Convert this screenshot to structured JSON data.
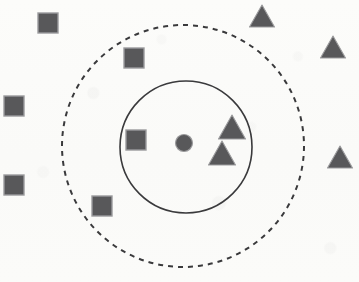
{
  "figure": {
    "canvas": {
      "width": 359,
      "height": 282,
      "background": "#fbfbf9"
    },
    "palette": {
      "shape_fill": "#58585a",
      "shape_stroke": "#9b9b9d",
      "boundary_stroke": "#3a3a3c",
      "background": "#fbfbf9"
    },
    "boundaries": [
      {
        "name": "outer-boundary",
        "shape": "circle",
        "style": "dashed",
        "cx": 183,
        "cy": 146,
        "r": 121,
        "stroke": "#3a3a3c",
        "stroke_width": 2,
        "dash": "5 5"
      },
      {
        "name": "inner-boundary",
        "shape": "circle",
        "style": "solid",
        "cx": 186,
        "cy": 147,
        "r": 66,
        "stroke": "#3a3a3c",
        "stroke_width": 1.6,
        "dash": "none"
      }
    ],
    "centroid": {
      "name": "centroid-marker",
      "shape": "circle",
      "cx": 184,
      "cy": 143,
      "r": 8.5,
      "fill": "#58585a",
      "stroke": "#9b9b9d"
    },
    "squares": [
      {
        "id": "square-outside-top-left",
        "x": 38,
        "y": 13,
        "size": 20,
        "region": "outside"
      },
      {
        "id": "square-ring-top",
        "x": 124,
        "y": 48,
        "size": 20,
        "region": "outer-ring"
      },
      {
        "id": "square-outside-left-upper",
        "x": 4,
        "y": 96,
        "size": 20,
        "region": "outside"
      },
      {
        "id": "square-inner-core",
        "x": 126,
        "y": 130,
        "size": 20,
        "region": "inner-core"
      },
      {
        "id": "square-outside-left-lower",
        "x": 4,
        "y": 175,
        "size": 20,
        "region": "outside"
      },
      {
        "id": "square-ring-bottom",
        "x": 92,
        "y": 196,
        "size": 20,
        "region": "outer-ring"
      }
    ],
    "triangles": [
      {
        "id": "triangle-outside-top",
        "cx": 262,
        "cy": 16,
        "width": 25,
        "height": 22,
        "region": "outside"
      },
      {
        "id": "triangle-outside-right-upper",
        "cx": 333,
        "cy": 47,
        "width": 25,
        "height": 22,
        "region": "outside"
      },
      {
        "id": "triangle-inner-core-upper",
        "cx": 232,
        "cy": 127,
        "width": 27,
        "height": 24,
        "region": "inner-core"
      },
      {
        "id": "triangle-outside-right-lower",
        "cx": 340,
        "cy": 157,
        "width": 25,
        "height": 22,
        "region": "outside"
      },
      {
        "id": "triangle-inner-core-lower",
        "cx": 222,
        "cy": 153,
        "width": 27,
        "height": 24,
        "region": "inner-core"
      }
    ],
    "counts": {
      "squares_total": 6,
      "triangles_total": 5,
      "centroids_total": 1,
      "boundaries_total": 2
    }
  }
}
